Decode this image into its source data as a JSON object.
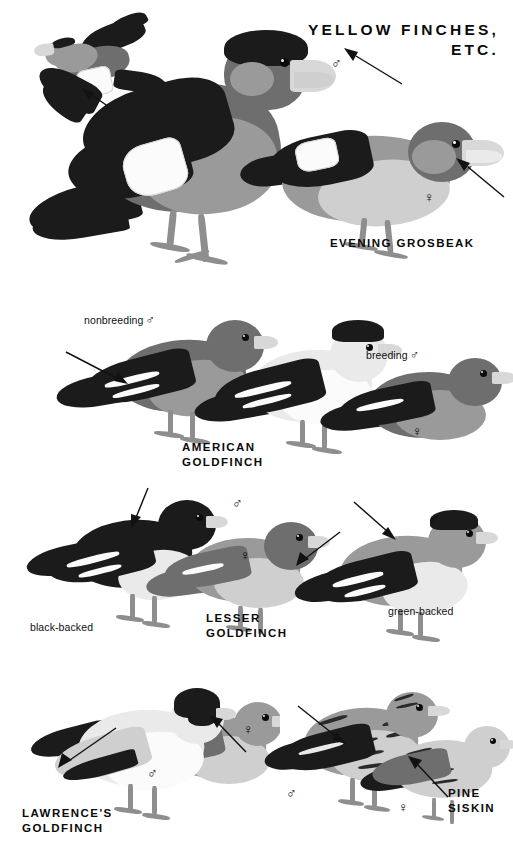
{
  "page": {
    "width": 513,
    "height": 862,
    "background_color": "#ffffff",
    "ink_color": "#0a0a0a",
    "type": "field-guide-plate"
  },
  "plate_title": "YELLOW FINCHES,\nETC.",
  "symbols": {
    "male": "♂",
    "female": "♀"
  },
  "species": [
    {
      "id": "evening-grosbeak",
      "name": "EVENING GROSBEAK",
      "name_lines": "EVENING GROSBEAK",
      "labels": [],
      "sexes": [
        "♂",
        "♀"
      ]
    },
    {
      "id": "american-goldfinch",
      "name": "AMERICAN GOLDFINCH",
      "name_lines": "AMERICAN\nGOLDFINCH",
      "labels": [
        "nonbreeding",
        "breeding"
      ],
      "sexes": [
        "♂",
        "♂",
        "♀"
      ]
    },
    {
      "id": "lesser-goldfinch",
      "name": "LESSER GOLDFINCH",
      "name_lines": "LESSER\nGOLDFINCH",
      "labels": [
        "black-backed",
        "green-backed"
      ],
      "sexes": [
        "♂",
        "♀",
        "♂"
      ]
    },
    {
      "id": "lawrences-goldfinch",
      "name": "LAWRENCE'S GOLDFINCH",
      "name_lines": "LAWRENCE'S\nGOLDFINCH",
      "labels": [],
      "sexes": [
        "♂",
        "♀"
      ]
    },
    {
      "id": "pine-siskin",
      "name": "PINE SISKIN",
      "name_lines": "PINE\nSISKIN",
      "labels": [],
      "sexes": [
        "♂",
        "♀"
      ]
    }
  ],
  "annotations": {
    "evening_grosbeak_male_symbol": "♂",
    "evening_grosbeak_female_symbol": "♀",
    "american_goldfinch_nonbreeding_male": "nonbreeding ♂",
    "american_goldfinch_nonbreeding_label": "nonbreeding",
    "american_goldfinch_breeding_label": "breeding",
    "american_goldfinch_female_symbol": "♀",
    "lesser_goldfinch_male_symbol": "♂",
    "lesser_goldfinch_female_symbol": "♀",
    "lesser_goldfinch_green_male_symbol": "♂",
    "lesser_goldfinch_black_backed_label": "black-backed",
    "lesser_goldfinch_green_backed_label": "green-backed",
    "lawrences_goldfinch_male_symbol": "♂",
    "lawrences_goldfinch_female_symbol": "♀",
    "pine_siskin_male_symbol": "♂",
    "pine_siskin_female_symbol": "♀"
  }
}
